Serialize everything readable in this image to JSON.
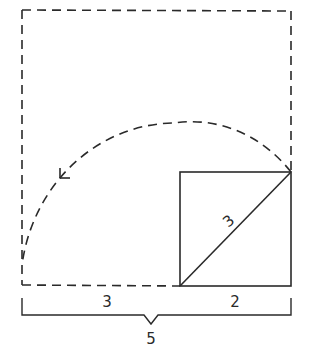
{
  "diagram": {
    "colors": {
      "stroke": "#2a2a2a",
      "background": "#ffffff"
    },
    "labels": {
      "diagonal": "3",
      "bottom_left_segment": "3",
      "bottom_right_segment": "2",
      "total_width": "5"
    },
    "shapes": {
      "outer_dashed_square": {
        "style": "dashed"
      },
      "inner_square": {
        "style": "solid"
      },
      "diagonal_line": {
        "style": "solid"
      },
      "arc": {
        "style": "dashed",
        "arrow": "arrow-head near left end"
      },
      "bracket": {
        "style": "solid"
      }
    }
  }
}
